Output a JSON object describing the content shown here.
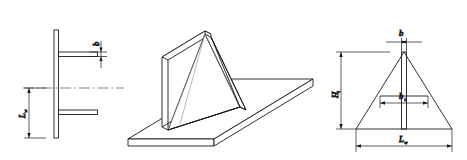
{
  "figure": {
    "type": "engineering-drawing",
    "background_color": "#ffffff",
    "line_color": "#1a1a1a"
  },
  "views": {
    "side_elevation": {
      "name": "side-elevation-view",
      "labels": {
        "plate_thickness": "b",
        "plate_thickness_sub": "",
        "weld_length": "L",
        "weld_length_sub": "w"
      }
    },
    "isometric": {
      "name": "isometric-view",
      "labels": {}
    },
    "front_elevation": {
      "name": "front-elevation-view",
      "labels": {
        "top_width": "b",
        "top_width_sub": "",
        "inner_width": "b",
        "inner_width_sub": "i",
        "height": "H",
        "height_sub": "i",
        "base_width": "L",
        "base_width_sub": "w"
      }
    }
  },
  "dimensions": {
    "b": "b",
    "b_i": "bi",
    "H_i": "Hi",
    "L_w": "Lw"
  }
}
